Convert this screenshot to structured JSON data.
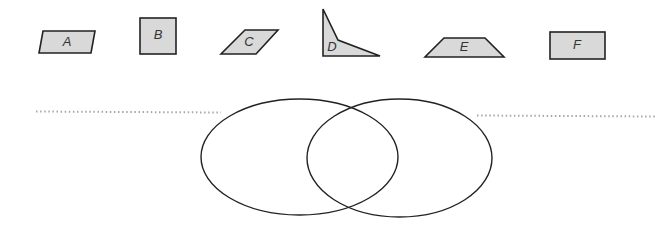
{
  "diagram": {
    "shapes": [
      {
        "id": "A",
        "label": "A",
        "kind": "parallelogram",
        "fill": "#d9d9d9"
      },
      {
        "id": "B",
        "label": "B",
        "kind": "square",
        "fill": "#d9d9d9"
      },
      {
        "id": "C",
        "label": "C",
        "kind": "rhombus",
        "fill": "#d9d9d9"
      },
      {
        "id": "D",
        "label": "D",
        "kind": "concave-quadrilateral",
        "fill": "#d9d9d9"
      },
      {
        "id": "E",
        "label": "E",
        "kind": "trapezoid",
        "fill": "#d9d9d9"
      },
      {
        "id": "F",
        "label": "F",
        "kind": "rectangle",
        "fill": "#d9d9d9"
      }
    ],
    "venn": {
      "left_circle_label": "",
      "right_circle_label": "",
      "left_answer_line": "",
      "right_answer_line": ""
    },
    "colors": {
      "shape_fill": "#d9d9d9",
      "stroke": "#222222",
      "dotted_line": "#a8a8a8"
    }
  }
}
